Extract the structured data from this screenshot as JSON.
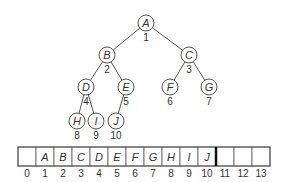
{
  "tree": {
    "nodes": [
      {
        "label": "A",
        "index": "1",
        "x": 146,
        "y": 23
      },
      {
        "label": "B",
        "index": "2",
        "x": 107,
        "y": 55
      },
      {
        "label": "C",
        "index": "3",
        "x": 189,
        "y": 55
      },
      {
        "label": "D",
        "index": "4",
        "x": 86,
        "y": 87
      },
      {
        "label": "E",
        "index": "5",
        "x": 126,
        "y": 87
      },
      {
        "label": "F",
        "index": "6",
        "x": 170,
        "y": 87
      },
      {
        "label": "G",
        "index": "7",
        "x": 209,
        "y": 87
      },
      {
        "label": "H",
        "index": "8",
        "x": 77,
        "y": 121
      },
      {
        "label": "I",
        "index": "9",
        "x": 96,
        "y": 121
      },
      {
        "label": "J",
        "index": "10",
        "x": 116,
        "y": 121
      }
    ],
    "edges": [
      [
        "A",
        "B"
      ],
      [
        "A",
        "C"
      ],
      [
        "B",
        "D"
      ],
      [
        "B",
        "E"
      ],
      [
        "C",
        "F"
      ],
      [
        "C",
        "G"
      ],
      [
        "D",
        "H"
      ],
      [
        "D",
        "I"
      ],
      [
        "E",
        "J"
      ]
    ]
  },
  "array": {
    "cells": [
      "",
      "A",
      "B",
      "C",
      "D",
      "E",
      "F",
      "G",
      "H",
      "I",
      "J",
      "",
      "",
      ""
    ],
    "indices": [
      "0",
      "1",
      "2",
      "3",
      "4",
      "5",
      "6",
      "7",
      "8",
      "9",
      "10",
      "11",
      "12",
      "13"
    ],
    "boundary_after_index": 10
  }
}
